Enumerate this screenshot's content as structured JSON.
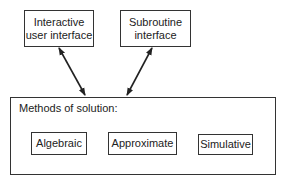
{
  "diagram": {
    "top_boxes": [
      {
        "line1": "Interactive",
        "line2": "user interface"
      },
      {
        "line1": "Subroutine",
        "line2": "interface"
      }
    ],
    "container": {
      "title": "Methods of solution:",
      "methods": [
        {
          "label": "Algebraic"
        },
        {
          "label": "Approximate"
        },
        {
          "label": "Simulative"
        }
      ]
    },
    "connections": [
      {
        "from": "Interactive user interface",
        "to": "Methods of solution",
        "type": "bidirectional"
      },
      {
        "from": "Subroutine interface",
        "to": "Methods of solution",
        "type": "bidirectional"
      },
      {
        "from": "Approximate",
        "to": "Algebraic",
        "type": "directed"
      },
      {
        "from": "Algebraic",
        "to": "Approximate",
        "type": "directed"
      }
    ],
    "colors": {
      "line": "#222222",
      "background": "#ffffff"
    }
  }
}
